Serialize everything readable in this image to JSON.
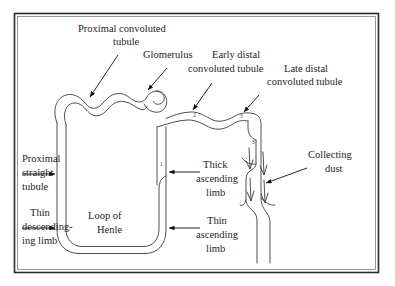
{
  "figure": {
    "border_color": "#2a2a2a",
    "line_color": "#3b3b3b",
    "text_color": "#1d1d1d",
    "background": "#ffffff"
  },
  "labels": {
    "proximal_convoluted_tubule": {
      "line1": "Proximal convoluted",
      "line2": "tubule"
    },
    "glomerulus": {
      "line1": "Glomerulus"
    },
    "early_distal_convoluted_tubule": {
      "line1": "Early distal",
      "line2": "convoluted tubule"
    },
    "late_distal_convoluted_tubule": {
      "line1": "Late distal",
      "line2": "convoluted tubule"
    },
    "collecting_duct": {
      "line1": "Collecting",
      "line2": "dust"
    },
    "proximal_straight_tubule": {
      "line1": "Proximal",
      "line2": "straight",
      "line3": "tubule"
    },
    "thin_descending_limb": {
      "line1": "Thin",
      "line2": "descending-",
      "line3": "ing limb"
    },
    "loop_of_henle": {
      "line1": "Loop of",
      "line2": "Henle"
    },
    "thick_ascending_limb": {
      "line1": "Thick",
      "line2": "ascending",
      "line3": "limb"
    },
    "thin_ascending_limb": {
      "line1": "Thin",
      "line2": "ascending",
      "line3": "limb"
    }
  },
  "numeric_markers": [
    {
      "id": "marker-1",
      "value": "1"
    },
    {
      "id": "marker-2",
      "value": "2"
    },
    {
      "id": "marker-3-top",
      "value": "3"
    },
    {
      "id": "marker-3-duct",
      "value": "3"
    }
  ]
}
